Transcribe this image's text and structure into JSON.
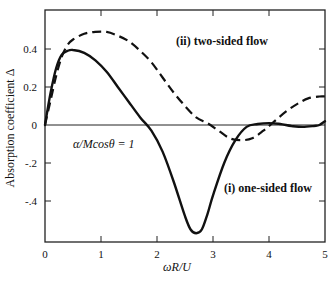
{
  "chart_data": {
    "type": "line",
    "title": "",
    "xlabel": "ωR/U",
    "ylabel": "Absorption coefficient Δ",
    "xlim": [
      0,
      5
    ],
    "ylim": [
      -0.6,
      0.6
    ],
    "xticks": [
      0,
      1,
      2,
      3,
      4,
      5
    ],
    "xtick_labels": [
      "0",
      "1",
      "2",
      "3",
      "4",
      "5"
    ],
    "yticks": [
      -0.4,
      -0.2,
      0,
      0.2,
      0.4
    ],
    "ytick_labels": [
      "-.4",
      "-.2",
      "0",
      "0.2",
      "0.4"
    ],
    "grid": false,
    "zero_line": true,
    "legend": "inline annotations",
    "annotations": [
      {
        "text": "(ii) two-sided flow",
        "x": 2.35,
        "y": 0.42,
        "bold": true
      },
      {
        "text": "(i) one-sided flow",
        "x": 3.2,
        "y": -0.33,
        "bold": true
      },
      {
        "text": "α/Mcosθ = 1",
        "x": 0.55,
        "y": -0.06,
        "italic_parts": [
          "α",
          "M"
        ]
      }
    ],
    "series": [
      {
        "name": "(i) one-sided flow",
        "style": "solid",
        "x": [
          0,
          0.1,
          0.2,
          0.3,
          0.4,
          0.5,
          0.7,
          0.9,
          1.1,
          1.3,
          1.5,
          1.7,
          1.9,
          2.1,
          2.3,
          2.5,
          2.6,
          2.7,
          2.8,
          2.9,
          3.0,
          3.2,
          3.4,
          3.6,
          3.8,
          4.0,
          4.2,
          4.4,
          4.6,
          4.8,
          4.9,
          5.0
        ],
        "values": [
          0,
          0.17,
          0.3,
          0.37,
          0.39,
          0.395,
          0.38,
          0.34,
          0.28,
          0.2,
          0.12,
          0.04,
          -0.03,
          -0.14,
          -0.3,
          -0.48,
          -0.55,
          -0.57,
          -0.55,
          -0.47,
          -0.37,
          -0.2,
          -0.08,
          -0.01,
          0.005,
          0.01,
          0.005,
          -0.005,
          -0.01,
          -0.005,
          0.0,
          0.02
        ]
      },
      {
        "name": "(ii) two-sided flow",
        "style": "dashed",
        "x": [
          0,
          0.1,
          0.2,
          0.3,
          0.4,
          0.5,
          0.7,
          0.9,
          1.1,
          1.3,
          1.5,
          1.7,
          1.9,
          2.1,
          2.3,
          2.5,
          2.7,
          2.9,
          3.1,
          3.3,
          3.5,
          3.7,
          3.9,
          4.1,
          4.3,
          4.5,
          4.7,
          4.9,
          5.0
        ],
        "values": [
          0,
          0.13,
          0.26,
          0.36,
          0.42,
          0.45,
          0.48,
          0.49,
          0.49,
          0.47,
          0.44,
          0.39,
          0.33,
          0.25,
          0.17,
          0.1,
          0.04,
          0.01,
          -0.03,
          -0.07,
          -0.08,
          -0.07,
          -0.03,
          0.02,
          0.07,
          0.11,
          0.14,
          0.15,
          0.15
        ]
      }
    ],
    "colors": {
      "line": "#111111",
      "frame": "#222222",
      "background": "#ffffff"
    }
  }
}
